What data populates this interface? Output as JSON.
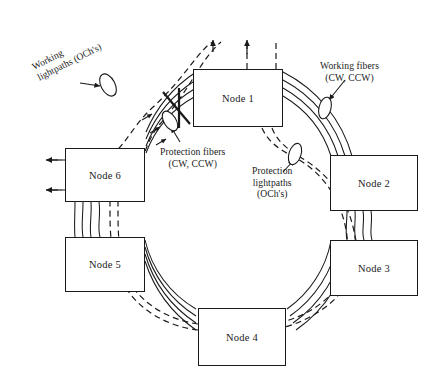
{
  "figure": {
    "stroke_color": "#1a1a1a",
    "background": "#ffffff"
  },
  "nodes": [
    {
      "label": "Node 1",
      "x": 193,
      "y": 69,
      "w": 90,
      "h": 58
    },
    {
      "label": "Node 2",
      "x": 330,
      "y": 155,
      "w": 88,
      "h": 56
    },
    {
      "label": "Node 3",
      "x": 330,
      "y": 240,
      "w": 88,
      "h": 56
    },
    {
      "label": "Node 4",
      "x": 198,
      "y": 308,
      "w": 88,
      "h": 58
    },
    {
      "label": "Node 5",
      "x": 65,
      "y": 237,
      "w": 80,
      "h": 55
    },
    {
      "label": "Node 6",
      "x": 65,
      "y": 148,
      "w": 80,
      "h": 54
    }
  ],
  "annotations": [
    {
      "name": "working-lightpaths",
      "lines": [
        "Working",
        "lightpaths (OCh's)"
      ],
      "text": "Working lightpaths (OCh's)",
      "rotated": true,
      "x": 30,
      "y": 62
    },
    {
      "name": "working-fibers",
      "lines": [
        "Working fibers",
        "(CW, CCW)"
      ],
      "text": "Working fibers (CW, CCW)",
      "rotated": false,
      "x": 320,
      "y": 60
    },
    {
      "name": "protection-fibers",
      "lines": [
        "Protection fibers",
        "(CW, CCW)"
      ],
      "text": "Protection fibers (CW, CCW)",
      "rotated": false,
      "x": 160,
      "y": 146
    },
    {
      "name": "protection-lightpaths",
      "lines": [
        "Protection",
        "lightpaths",
        "(OCh's)"
      ],
      "text": "Protection lightpaths (OCh's)",
      "rotated": false,
      "x": 252,
      "y": 165
    }
  ],
  "markers": {
    "fiber_cut": {
      "name": "fiber-cut-x",
      "x": 178,
      "y": 100
    },
    "ellipses": [
      {
        "name": "working-lightpaths-ellipse",
        "cx": 108,
        "cy": 85,
        "rx": 7,
        "ry": 12,
        "rot": -28
      },
      {
        "name": "working-fibers-ellipse",
        "cx": 325,
        "cy": 108,
        "rx": 6,
        "ry": 11,
        "rot": 14
      },
      {
        "name": "protection-fibers-ellipse",
        "cx": 170,
        "cy": 121,
        "rx": 6,
        "ry": 11,
        "rot": -32
      },
      {
        "name": "protection-lightpaths-ellipse",
        "cx": 295,
        "cy": 154,
        "rx": 6,
        "ry": 11,
        "rot": 18
      }
    ]
  },
  "ring": {
    "center_x": 224,
    "center_y": 198,
    "radii": [
      108,
      117,
      126,
      135
    ],
    "fiber_count": 4,
    "fiber_legend": [
      "working CW",
      "working CCW",
      "protection CW",
      "protection CCW"
    ]
  }
}
